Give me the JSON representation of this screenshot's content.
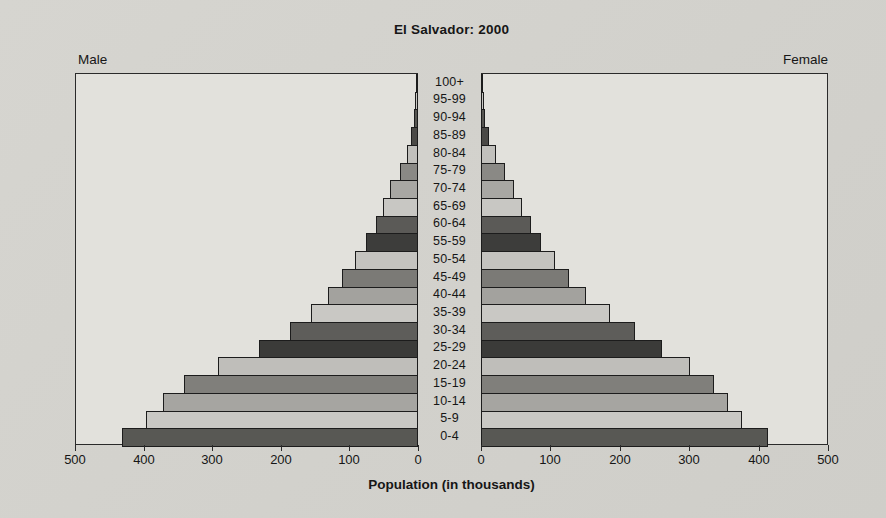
{
  "title": "El Salvador: 2000",
  "headers": {
    "male": "Male",
    "female": "Female"
  },
  "x_axis": {
    "label": "Population (in thousands)",
    "male_tick_labels": [
      "500",
      "400",
      "300",
      "200",
      "100",
      "0"
    ],
    "female_tick_labels": [
      "0",
      "100",
      "200",
      "300",
      "400",
      "500"
    ]
  },
  "chart_data": {
    "type": "bar",
    "subtype": "population_pyramid",
    "title": "El Salvador: 2000",
    "xlabel": "Population (in thousands)",
    "unit": "thousands",
    "xlim": [
      0,
      500
    ],
    "tick_step": 100,
    "grid": false,
    "legend": "none",
    "age_groups": [
      "100+",
      "95-99",
      "90-94",
      "85-89",
      "80-84",
      "75-79",
      "70-74",
      "65-69",
      "60-64",
      "55-59",
      "50-54",
      "45-49",
      "40-44",
      "35-39",
      "30-34",
      "25-29",
      "20-24",
      "15-19",
      "10-14",
      "5-9",
      "0-4"
    ],
    "series": [
      {
        "name": "Male",
        "side": "left",
        "values": [
          1,
          3,
          5,
          9,
          15,
          25,
          40,
          50,
          60,
          75,
          90,
          110,
          130,
          155,
          185,
          230,
          290,
          340,
          370,
          395,
          430
        ]
      },
      {
        "name": "Female",
        "side": "right",
        "values": [
          1,
          3,
          5,
          10,
          20,
          33,
          46,
          58,
          70,
          85,
          105,
          125,
          150,
          185,
          220,
          260,
          300,
          335,
          355,
          375,
          412
        ]
      }
    ],
    "bar_colors": [
      "#a6a5a1",
      "#c9c8c4",
      "#565551",
      "#4a4946",
      "#c1c0bc",
      "#8a8985",
      "#a8a7a3",
      "#c8c7c3",
      "#5b5a57",
      "#3d3d3b",
      "#c4c3bf",
      "#7b7a76",
      "#a3a29e",
      "#c9c8c4",
      "#5e5d5a",
      "#3b3b39",
      "#bfbeba",
      "#807f7b",
      "#a6a5a1",
      "#c9c8c4",
      "#585854"
    ],
    "colors": {
      "outline": "#1c1c1c",
      "plot_background": "#e2e1dc",
      "page_background": "#d3d2cd"
    }
  }
}
